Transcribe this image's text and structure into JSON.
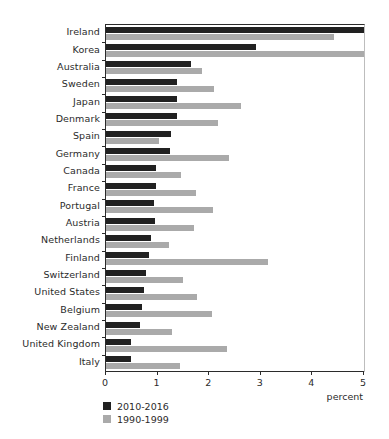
{
  "chart_data": {
    "type": "bar",
    "orientation": "horizontal",
    "title": "",
    "xlabel": "percent",
    "ylabel": "",
    "xlim": [
      0,
      5
    ],
    "xticks": [
      "0",
      "1",
      "2",
      "3",
      "4",
      "5"
    ],
    "grid": false,
    "legend_position": "bottom-left",
    "categories": [
      "Ireland",
      "Korea",
      "Australia",
      "Sweden",
      "Japan",
      "Denmark",
      "Spain",
      "Germany",
      "Canada",
      "France",
      "Portugal",
      "Austria",
      "Netherlands",
      "Finland",
      "Switzerland",
      "United States",
      "Belgium",
      "New Zealand",
      "United Kingdom",
      "Italy"
    ],
    "series": [
      {
        "name": "2010-2016",
        "color": "#212121",
        "values": [
          5.0,
          2.91,
          1.65,
          1.38,
          1.38,
          1.37,
          1.26,
          1.24,
          0.97,
          0.97,
          0.93,
          0.95,
          0.87,
          0.83,
          0.78,
          0.74,
          0.7,
          0.66,
          0.48,
          0.48
        ]
      },
      {
        "name": "1990-1999",
        "color": "#aaaaaa",
        "values": [
          4.42,
          5.0,
          1.86,
          2.09,
          2.62,
          2.17,
          1.03,
          2.38,
          1.45,
          1.74,
          2.07,
          1.7,
          1.22,
          3.14,
          1.49,
          1.76,
          2.05,
          1.28,
          2.34,
          1.43
        ]
      }
    ]
  },
  "legend": {
    "items": [
      {
        "label": "2010-2016",
        "color": "#212121"
      },
      {
        "label": "1990-1999",
        "color": "#aaaaaa"
      }
    ]
  }
}
